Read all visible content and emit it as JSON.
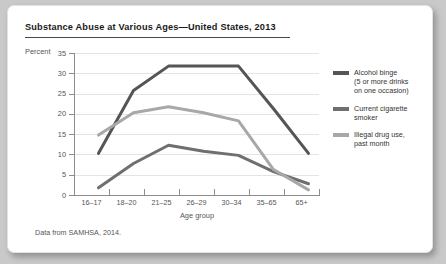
{
  "card": {
    "title": "Substance Abuse at Various Ages—United States, 2013",
    "source": "Data from SAMHSA, 2014."
  },
  "chart_data": {
    "type": "line",
    "title": "Substance Abuse at Various Ages—United States, 2013",
    "xlabel": "Age group",
    "ylabel": "Percent",
    "ylim": [
      0,
      35
    ],
    "yticks": [
      0,
      5,
      10,
      15,
      20,
      25,
      30,
      35
    ],
    "grid": true,
    "legend_position": "right",
    "categories": [
      "16–17",
      "18–20",
      "21–25",
      "26–29",
      "30–34",
      "35–65",
      "65+"
    ],
    "series": [
      {
        "name": "Alcohol binge\n(5 or more drinks\non one occasion)",
        "color": "#555555",
        "values": [
          11.5,
          27,
          33,
          33,
          33,
          22.5,
          11.5
        ]
      },
      {
        "name": "Current cigarette\nsmoker",
        "color": "#6f6f6f",
        "values": [
          3,
          9,
          13.5,
          12,
          11,
          7,
          4
        ]
      },
      {
        "name": "Illegal drug use,\npast month",
        "color": "#a8a8a8",
        "values": [
          16,
          21.5,
          23,
          21.5,
          19.5,
          7.5,
          2.5
        ]
      }
    ]
  },
  "legend": [
    {
      "label": "Alcohol binge\n(5 or more drinks\non one occasion)",
      "color": "#555555"
    },
    {
      "label": "Current cigarette\nsmoker",
      "color": "#6f6f6f"
    },
    {
      "label": "Illegal drug use,\npast month",
      "color": "#a8a8a8"
    }
  ]
}
